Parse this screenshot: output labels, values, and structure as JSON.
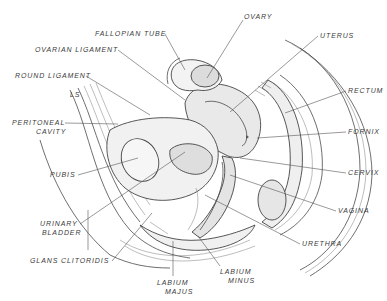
{
  "diagram": {
    "type": "anatomical-illustration",
    "signature": "LS",
    "labels": [
      {
        "id": "fallopian-tube",
        "text": "FALLOPIAN TUBE",
        "x": 95,
        "y": 36,
        "target": [
          185,
          70
        ]
      },
      {
        "id": "ovary",
        "text": "OVARY",
        "x": 243,
        "y": 19,
        "target": [
          207,
          78
        ]
      },
      {
        "id": "uterus",
        "text": "UTERUS",
        "x": 320,
        "y": 38,
        "target": [
          230,
          112
        ]
      },
      {
        "id": "ovarian-ligament",
        "text": "OVARIAN LIGAMENT",
        "x": 35,
        "y": 52,
        "target": [
          185,
          100
        ]
      },
      {
        "id": "round-ligament",
        "text": "ROUND LIGAMENT",
        "x": 15,
        "y": 78,
        "target": [
          150,
          115
        ]
      },
      {
        "id": "rectum",
        "text": "RECTUM",
        "x": 348,
        "y": 93,
        "target": [
          285,
          113
        ]
      },
      {
        "id": "peritoneal-cavity",
        "text": "PERITONEAL",
        "x2_text": "CAVITY",
        "x": 12,
        "y": 125,
        "target": [
          118,
          124
        ]
      },
      {
        "id": "fornix",
        "text": "FORNIX",
        "x": 348,
        "y": 134,
        "target": [
          257,
          138
        ]
      },
      {
        "id": "pubis",
        "text": "PUBIS",
        "x": 50,
        "y": 177,
        "target": [
          138,
          158
        ]
      },
      {
        "id": "cervix",
        "text": "CERVIX",
        "x": 348,
        "y": 175,
        "target": [
          240,
          158
        ]
      },
      {
        "id": "urinary-bladder",
        "text": "URINARY",
        "x2_text": "BLADDER",
        "x": 38,
        "y": 226,
        "target": [
          185,
          152
        ]
      },
      {
        "id": "vagina",
        "text": "VAGINA",
        "x": 338,
        "y": 213,
        "target": [
          230,
          175
        ]
      },
      {
        "id": "urethra",
        "text": "URETHRA",
        "x": 302,
        "y": 246,
        "target": [
          205,
          195
        ]
      },
      {
        "id": "glans-clitoridis",
        "text": "GLANS CLITORIDIS",
        "x": 30,
        "y": 263,
        "target": [
          152,
          213
        ]
      },
      {
        "id": "labium-minus",
        "text": "LABIUM",
        "x2_text": "MINUS",
        "x": 220,
        "y": 271,
        "target": [
          198,
          236
        ]
      },
      {
        "id": "labium-majus",
        "text": "LABIUM",
        "x2_text": "MAJUS",
        "x": 158,
        "y": 283,
        "target": [
          173,
          241
        ]
      }
    ]
  }
}
